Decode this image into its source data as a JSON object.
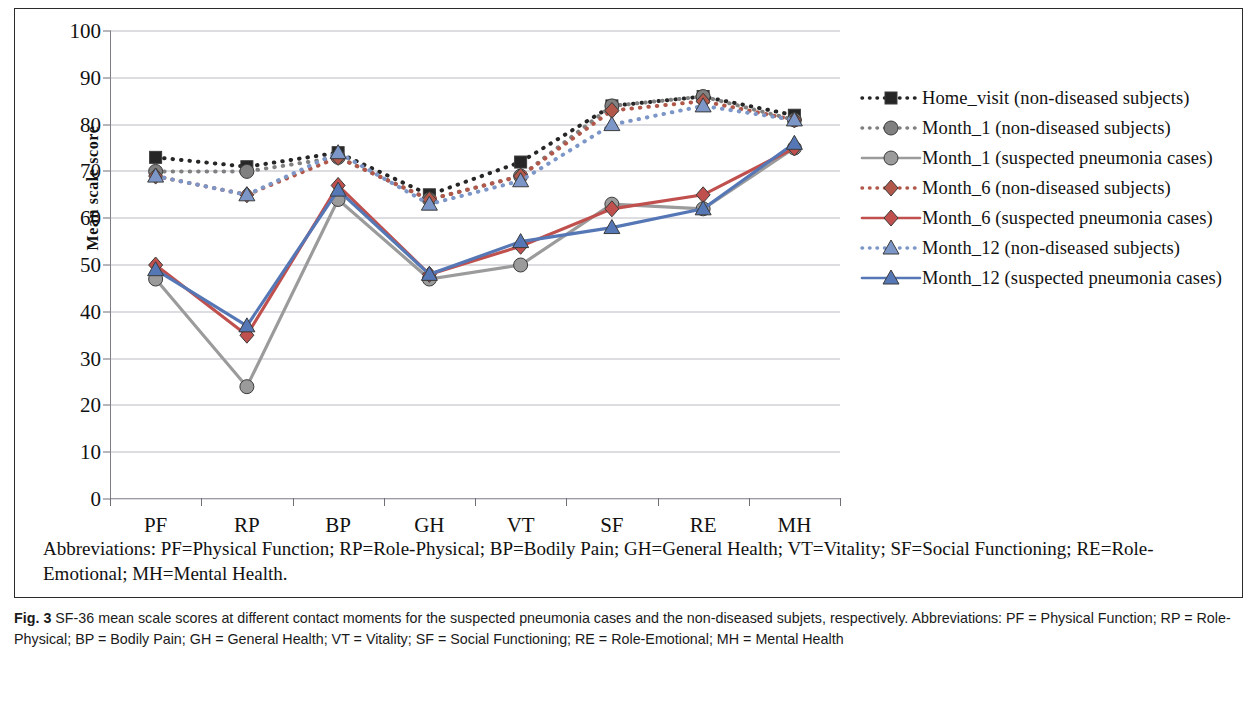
{
  "figure": {
    "y_axis_title": "Mean scale score",
    "abbreviations_line1": "Abbreviations: PF=Physical Function; RP=Role-Physical; BP=Bodily Pain; GH=General Health; VT=Vitality; SF=Social",
    "abbreviations_line2": "Functioning; RE=Role-Emotional; MH=Mental Health.",
    "caption_label": "Fig. 3",
    "caption_text": " SF-36 mean scale scores at different contact moments for the suspected pneumonia cases and the non-diseased subjets, respectively. Abbreviations: PF = Physical Function; RP = Role-Physical; BP = Bodily Pain; GH = General Health; VT = Vitality; SF = Social Functioning; RE = Role-Emotional; MH = Mental Health"
  },
  "chart_data": {
    "type": "line",
    "title": "",
    "xlabel": "",
    "ylabel": "Mean scale score",
    "ylim": [
      0,
      100
    ],
    "ytick_values": [
      0,
      10,
      20,
      30,
      40,
      50,
      60,
      70,
      80,
      90,
      100
    ],
    "grid": true,
    "legend_position": "right",
    "categories": [
      "PF",
      "RP",
      "BP",
      "GH",
      "VT",
      "SF",
      "RE",
      "MH"
    ],
    "series": [
      {
        "name": "Home_visit (non-diseased subjects)",
        "color": "#262626",
        "marker": "square",
        "linestyle": "dotted",
        "values": [
          73,
          71,
          74,
          65,
          72,
          84,
          86,
          82
        ]
      },
      {
        "name": "Month_1 (non-diseased subjects)",
        "color": "#808080",
        "marker": "circle",
        "linestyle": "dotted",
        "values": [
          70,
          70,
          73,
          64,
          69,
          84,
          86,
          81
        ]
      },
      {
        "name": "Month_1 (suspected pneumonia cases)",
        "color": "#9b9b9b",
        "marker": "circle",
        "linestyle": "solid",
        "values": [
          47,
          24,
          64,
          47,
          50,
          63,
          62,
          75
        ]
      },
      {
        "name": "Month_6 (non-diseased subjects)",
        "color": "#b2584a",
        "marker": "diamond",
        "linestyle": "dotted",
        "values": [
          69,
          65,
          73,
          64,
          69,
          83,
          85,
          81
        ]
      },
      {
        "name": "Month_6 (suspected pneumonia cases)",
        "color": "#c0504d",
        "marker": "diamond",
        "linestyle": "solid",
        "values": [
          50,
          35,
          67,
          48,
          54,
          62,
          65,
          75
        ]
      },
      {
        "name": "Month_12 (non-diseased subjects)",
        "color": "#7c96c8",
        "marker": "triangle",
        "linestyle": "dotted",
        "values": [
          69,
          65,
          74,
          63,
          68,
          80,
          84,
          81
        ]
      },
      {
        "name": "Month_12 (suspected pneumonia cases)",
        "color": "#5577b5",
        "marker": "triangle",
        "linestyle": "solid",
        "values": [
          49,
          37,
          66,
          48,
          55,
          58,
          62,
          76
        ]
      }
    ]
  }
}
